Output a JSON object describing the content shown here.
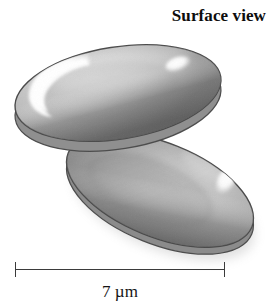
{
  "figure": {
    "title": "Surface view",
    "scale_bar": {
      "label": "7 µm",
      "value": 7,
      "unit": "µm",
      "length_px": 210,
      "tick_left_x": 15,
      "tick_right_x": 224
    },
    "colors": {
      "background": "#ffffff",
      "outline": "#4a4a4a",
      "cell_light": "#d8d8d8",
      "cell_mid": "#b8b8b8",
      "cell_dark": "#8a8a8a",
      "cell_shadow": "#6e6e6e",
      "highlight": "#ffffff",
      "text": "#0d0d0d"
    },
    "cells": [
      {
        "name": "upper-cell",
        "shape": "biconcave-disc",
        "center_x": 118,
        "center_y": 96,
        "radius_x": 104,
        "radius_y": 48,
        "rotation_deg": -9,
        "highlights": [
          "left-crescent",
          "upper-right-spot"
        ]
      },
      {
        "name": "lower-cell",
        "shape": "biconcave-disc",
        "center_x": 160,
        "center_y": 190,
        "radius_x": 100,
        "radius_y": 48,
        "rotation_deg": 22,
        "highlights": [
          "right-spot"
        ]
      }
    ]
  }
}
